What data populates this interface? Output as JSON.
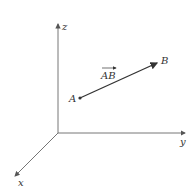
{
  "diagram": {
    "type": "3d-vector-diagram",
    "axes": [
      {
        "name": "z",
        "label": "z"
      },
      {
        "name": "y",
        "label": "y"
      },
      {
        "name": "x",
        "label": "x"
      }
    ],
    "points": [
      {
        "name": "A",
        "label": "A"
      },
      {
        "name": "B",
        "label": "B"
      }
    ],
    "vector": {
      "from": "A",
      "to": "B",
      "label": "AB"
    },
    "colors": {
      "axis": "#555555",
      "vector": "#333333",
      "text": "#333333"
    }
  }
}
